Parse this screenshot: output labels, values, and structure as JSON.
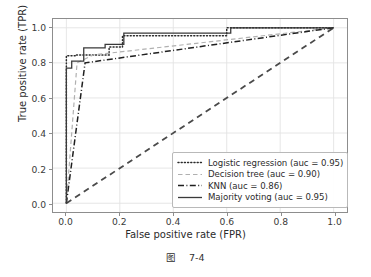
{
  "caption": {
    "prefix": "图",
    "number": "7-4"
  },
  "chart_data": {
    "type": "line",
    "title": "",
    "xlabel": "False positive rate (FPR)",
    "ylabel": "True positive rate (TPR)",
    "xlim": [
      -0.05,
      1.05
    ],
    "ylim": [
      -0.05,
      1.05
    ],
    "xticks": [
      "0.0",
      "0.2",
      "0.4",
      "0.6",
      "0.8",
      "1.0"
    ],
    "yticks": [
      "0.0",
      "0.2",
      "0.4",
      "0.6",
      "0.8",
      "1.0"
    ],
    "grid": true,
    "legend_position": "lower right",
    "series": [
      {
        "name": "Logistic regression (auc = 0.95)",
        "label": "Logistic regression",
        "auc": "0.95",
        "style": "dotted",
        "color": "#2b2b2b",
        "x": [
          0.0,
          0.0,
          0.035,
          0.035,
          0.16,
          0.16,
          0.21,
          0.21,
          0.6,
          0.6,
          1.0
        ],
        "y": [
          0.0,
          0.84,
          0.84,
          0.845,
          0.845,
          0.89,
          0.89,
          0.955,
          0.955,
          1.0,
          1.0
        ]
      },
      {
        "name": "Decision tree (auc = 0.90)",
        "label": "Decision tree",
        "auc": "0.90",
        "style": "dashed",
        "color": "#b0b0b0",
        "x": [
          0.0,
          0.04,
          0.1,
          1.0
        ],
        "y": [
          0.0,
          0.8,
          0.845,
          1.0
        ]
      },
      {
        "name": "KNN (auc = 0.86)",
        "label": "KNN",
        "auc": "0.86",
        "style": "dashdot",
        "color": "#1f1f1f",
        "x": [
          0.0,
          0.07,
          1.0
        ],
        "y": [
          0.0,
          0.8,
          1.0
        ]
      },
      {
        "name": "Majority voting (auc = 0.95)",
        "label": "Majority voting",
        "auc": "0.95",
        "style": "solid",
        "color": "#3a3a3a",
        "x": [
          0.0,
          0.0,
          0.02,
          0.02,
          0.065,
          0.065,
          0.145,
          0.145,
          0.215,
          0.215,
          0.615,
          0.615,
          1.0
        ],
        "y": [
          0.0,
          0.77,
          0.77,
          0.81,
          0.81,
          0.885,
          0.885,
          0.905,
          0.905,
          0.97,
          0.97,
          1.0,
          1.0
        ]
      }
    ],
    "reference_line": {
      "name": "chance-diagonal",
      "style": "dashed",
      "color": "#4a4a4a",
      "x": [
        0.0,
        1.0
      ],
      "y": [
        0.0,
        1.0
      ]
    }
  }
}
